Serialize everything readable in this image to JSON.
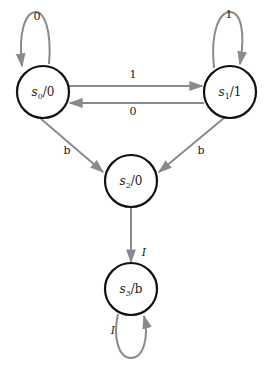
{
  "diagram": {
    "type": "state-machine",
    "colors": {
      "node_stroke": "#111111",
      "edge_stroke": "#8a8a8a",
      "text": "#222222",
      "background": "#ffffff"
    },
    "states": [
      {
        "id": "s0",
        "name": "s",
        "sub": "0",
        "output": "/0"
      },
      {
        "id": "s1",
        "name": "s",
        "sub": "1",
        "output": "/1"
      },
      {
        "id": "s2",
        "name": "s",
        "sub": "2",
        "output": "/0"
      },
      {
        "id": "s3",
        "name": "s",
        "sub": "3",
        "output": "/b"
      }
    ],
    "transitions": [
      {
        "from": "s0",
        "to": "s0",
        "label": "0"
      },
      {
        "from": "s1",
        "to": "s1",
        "label": "1"
      },
      {
        "from": "s0",
        "to": "s1",
        "label": "1"
      },
      {
        "from": "s1",
        "to": "s0",
        "label": "0"
      },
      {
        "from": "s0",
        "to": "s2",
        "label": "b"
      },
      {
        "from": "s1",
        "to": "s2",
        "label": "b"
      },
      {
        "from": "s2",
        "to": "s3",
        "label": "I"
      },
      {
        "from": "s3",
        "to": "s3",
        "label": "I"
      }
    ]
  }
}
